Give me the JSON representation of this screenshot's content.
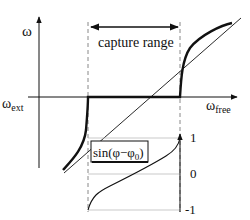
{
  "diagram": {
    "y_axis_label": "ω",
    "x_axis_label_main": "ω",
    "x_axis_label_sub": "free",
    "ext_label_main": "ω",
    "ext_label_sub": "ext",
    "capture_range_label": "capture range",
    "sine_box_label": "sin(φ−φ",
    "sine_box_sub": "0",
    "sine_box_close": ")",
    "sine_ticks": [
      "1",
      "0",
      "-1"
    ]
  },
  "colors": {
    "line": "#111111",
    "dashed": "#888888",
    "grid": "#bbbbbb"
  }
}
